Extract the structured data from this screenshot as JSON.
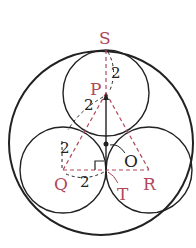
{
  "diagram": {
    "colors": {
      "stroke": "#222222",
      "accent": "#b0485a",
      "background": "#ffffff"
    },
    "points": {
      "S": "S",
      "P": "P",
      "Q": "Q",
      "R": "R",
      "T": "T",
      "O": "O"
    },
    "lengths": {
      "SP": "2",
      "PQ": "2",
      "QT": "2",
      "Q_vertical": "2"
    },
    "annotations": {
      "right_angle_at": "T",
      "center_marker": "O"
    }
  }
}
